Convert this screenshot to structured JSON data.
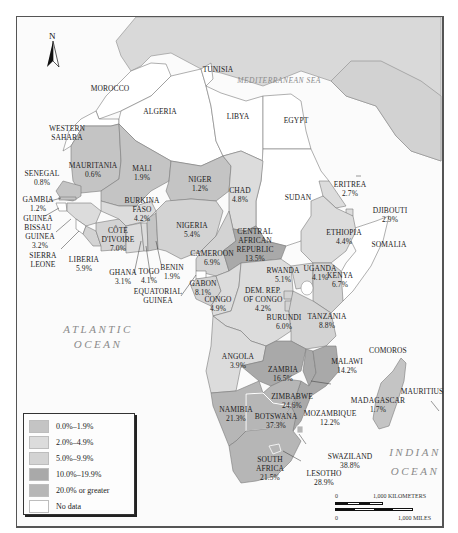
{
  "map": {
    "compass": {
      "label": "N",
      "icon": "north-arrow-icon"
    },
    "seas": {
      "mediterranean": "MEDITERRANEAN SEA",
      "red_sea": "RED SEA",
      "atlantic": [
        "ATLANTIC",
        "OCEAN"
      ],
      "indian": [
        "INDIAN",
        "OCEAN"
      ]
    },
    "countries": [
      {
        "name": "TUNISIA",
        "value": null,
        "category": "No data"
      },
      {
        "name": "MOROCCO",
        "value": null,
        "category": "No data"
      },
      {
        "name": "ALGERIA",
        "value": null,
        "category": "No data"
      },
      {
        "name": "LIBYA",
        "value": null,
        "category": "No data"
      },
      {
        "name": "EGYPT",
        "value": null,
        "category": "No data"
      },
      {
        "name": "WESTERN SAHARA",
        "value": null,
        "category": "No data"
      },
      {
        "name": "MAURITANIA",
        "value": "0.6%",
        "category": "0.0%–1.9%"
      },
      {
        "name": "MALI",
        "value": "1.9%",
        "category": "0.0%–1.9%"
      },
      {
        "name": "NIGER",
        "value": "1.2%",
        "category": "0.0%–1.9%"
      },
      {
        "name": "CHAD",
        "value": "4.8%",
        "category": "2.0%–4.9%"
      },
      {
        "name": "SUDAN",
        "value": null,
        "category": "No data"
      },
      {
        "name": "ERITREA",
        "value": "2.7%",
        "category": "2.0%–4.9%"
      },
      {
        "name": "DJIBOUTI",
        "value": "2.9%",
        "category": "2.0%–4.9%"
      },
      {
        "name": "ETHIOPIA",
        "value": "4.4%",
        "category": "2.0%–4.9%"
      },
      {
        "name": "SOMALIA",
        "value": null,
        "category": "No data"
      },
      {
        "name": "SENEGAL",
        "value": "0.8%",
        "category": "0.0%–1.9%"
      },
      {
        "name": "GAMBIA",
        "value": "1.2%",
        "category": "0.0%–1.9%"
      },
      {
        "name": "GUINEA BISSAU",
        "value": null,
        "category": "No data"
      },
      {
        "name": "GUINEA",
        "value": "3.2%",
        "category": "2.0%–4.9%"
      },
      {
        "name": "SIERRA LEONE",
        "value": null,
        "category": "No data"
      },
      {
        "name": "LIBERIA",
        "value": "5.9%",
        "category": "5.0%–9.9%"
      },
      {
        "name": "CÔTE D'IVOIRE",
        "value": "7.0%",
        "category": "5.0%–9.9%"
      },
      {
        "name": "BURKINA FASO",
        "value": "4.2%",
        "category": "2.0%–4.9%"
      },
      {
        "name": "GHANA",
        "value": "3.1%",
        "category": "2.0%–4.9%"
      },
      {
        "name": "TOGO",
        "value": "4.1%",
        "category": "2.0%–4.9%"
      },
      {
        "name": "BENIN",
        "value": "1.9%",
        "category": "0.0%–1.9%"
      },
      {
        "name": "NIGERIA",
        "value": "5.4%",
        "category": "5.0%–9.9%"
      },
      {
        "name": "CAMEROON",
        "value": "6.9%",
        "category": "5.0%–9.9%"
      },
      {
        "name": "EQUATORIAL GUINEA",
        "value": null,
        "category": "No data"
      },
      {
        "name": "CENTRAL AFRICAN REPUBLIC",
        "value": "13.5%",
        "category": "10.0%–19.9%"
      },
      {
        "name": "GABON",
        "value": "8.1%",
        "category": "5.0%–9.9%"
      },
      {
        "name": "CONGO",
        "value": "4.9%",
        "category": "2.0%–4.9%"
      },
      {
        "name": "DEM. REP. OF CONGO",
        "value": "4.2%",
        "category": "2.0%–4.9%"
      },
      {
        "name": "RWANDA",
        "value": "5.1%",
        "category": "5.0%–9.9%"
      },
      {
        "name": "UGANDA",
        "value": "4.1%",
        "category": "2.0%–4.9%"
      },
      {
        "name": "KENYA",
        "value": "6.7%",
        "category": "5.0%–9.9%"
      },
      {
        "name": "BURUNDI",
        "value": "6.0%",
        "category": "5.0%–9.9%"
      },
      {
        "name": "TANZANIA",
        "value": "8.8%",
        "category": "5.0%–9.9%"
      },
      {
        "name": "ANGOLA",
        "value": "3.9%",
        "category": "2.0%–4.9%"
      },
      {
        "name": "ZAMBIA",
        "value": "16.5%",
        "category": "10.0%–19.9%"
      },
      {
        "name": "MALAWI",
        "value": "14.2%",
        "category": "10.0%–19.9%"
      },
      {
        "name": "COMOROS",
        "value": null,
        "category": "No data"
      },
      {
        "name": "ZIMBABWE",
        "value": "24.6%",
        "category": "20.0% or greater"
      },
      {
        "name": "MOZAMBIQUE",
        "value": "12.2%",
        "category": "10.0%–19.9%"
      },
      {
        "name": "MADAGASCAR",
        "value": "1.7%",
        "category": "0.0%–1.9%"
      },
      {
        "name": "MAURITIUS",
        "value": null,
        "category": "No data"
      },
      {
        "name": "NAMIBIA",
        "value": "21.3%",
        "category": "20.0% or greater"
      },
      {
        "name": "BOTSWANA",
        "value": "37.3%",
        "category": "20.0% or greater"
      },
      {
        "name": "SWAZILAND",
        "value": "38.8%",
        "category": "20.0% or greater"
      },
      {
        "name": "SOUTH AFRICA",
        "value": "21.5%",
        "category": "20.0% or greater"
      },
      {
        "name": "LESOTHO",
        "value": "28.9%",
        "category": "20.0% or greater"
      }
    ],
    "labels": {
      "tunisia": "TUNISIA",
      "morocco": "MOROCCO",
      "algeria": "ALGERIA",
      "libya": "LIBYA",
      "egypt": "EGYPT",
      "western_sahara_1": "WESTERN",
      "western_sahara_2": "SAHARA",
      "mauritania": "MAURITANIA",
      "mauritania_v": "0.6%",
      "mali": "MALI",
      "mali_v": "1.9%",
      "niger": "NIGER",
      "niger_v": "1.2%",
      "chad": "CHAD",
      "chad_v": "4.8%",
      "sudan": "SUDAN",
      "eritrea": "ERITREA",
      "eritrea_v": "2.7%",
      "djibouti": "DJIBOUTI",
      "djibouti_v": "2.9%",
      "ethiopia": "ETHIOPIA",
      "ethiopia_v": "4.4%",
      "somalia": "SOMALIA",
      "senegal": "SENEGAL",
      "senegal_v": "0.8%",
      "gambia": "GAMBIA",
      "gambia_v": "1.2%",
      "guinea_bissau_1": "GUINEA",
      "guinea_bissau_2": "BISSAU",
      "guinea": "GUINEA",
      "guinea_v": "3.2%",
      "sierra_leone_1": "SIERRA",
      "sierra_leone_2": "LEONE",
      "liberia": "LIBERIA",
      "liberia_v": "5.9%",
      "cote_1": "CÔTE",
      "cote_2": "D'IVOIRE",
      "cote_v": "7.0%",
      "burkina_1": "BURKINA",
      "burkina_2": "FASO",
      "burkina_v": "4.2%",
      "ghana": "GHANA",
      "ghana_v": "3.1%",
      "togo": "TOGO",
      "togo_v": "4.1%",
      "benin": "BENIN",
      "benin_v": "1.9%",
      "nigeria": "NIGERIA",
      "nigeria_v": "5.4%",
      "cameroon": "CAMEROON",
      "cameroon_v": "6.9%",
      "eq_guinea_1": "EQUATORIAL",
      "eq_guinea_2": "GUINEA",
      "car_1": "CENTRAL",
      "car_2": "AFRICAN",
      "car_3": "REPUBLIC",
      "car_v": "13.5%",
      "gabon": "GABON",
      "gabon_v": "8.1%",
      "congo": "CONGO",
      "congo_v": "4.9%",
      "drc_1": "DEM. REP.",
      "drc_2": "OF CONGO",
      "drc_v": "4.2%",
      "rwanda": "RWANDA",
      "rwanda_v": "5.1%",
      "uganda": "UGANDA",
      "uganda_v": "4.1%",
      "kenya": "KENYA",
      "kenya_v": "6.7%",
      "burundi": "BURUNDI",
      "burundi_v": "6.0%",
      "tanzania": "TANZANIA",
      "tanzania_v": "8.8%",
      "angola": "ANGOLA",
      "angola_v": "3.9%",
      "zambia": "ZAMBIA",
      "zambia_v": "16.5%",
      "malawi": "MALAWI",
      "malawi_v": "14.2%",
      "comoros": "COMOROS",
      "zimbabwe": "ZIMBABWE",
      "zimbabwe_v": "24.6%",
      "mozambique": "MOZAMBIQUE",
      "mozambique_v": "12.2%",
      "madagascar": "MADAGASCAR",
      "madagascar_v": "1.7%",
      "mauritius": "MAURITIUS",
      "namibia": "NAMIBIA",
      "namibia_v": "21.3%",
      "botswana": "BOTSWANA",
      "botswana_v": "37.3%",
      "swaziland": "SWAZILAND",
      "swaziland_v": "38.8%",
      "south_africa_1": "SOUTH",
      "south_africa_2": "AFRICA",
      "south_africa_v": "21.5%",
      "lesotho": "LESOTHO",
      "lesotho_v": "28.9%"
    }
  },
  "legend": {
    "items": [
      {
        "label": "0.0%–1.9%",
        "color": "#c4c4c4"
      },
      {
        "label": "2.0%–4.9%",
        "color": "#dcdcdc"
      },
      {
        "label": "5.0%–9.9%",
        "color": "#d3d3d3"
      },
      {
        "label": "10.0%–19.9%",
        "color": "#a9a9a9"
      },
      {
        "label": "20.0% or greater",
        "color": "#b6b6b6"
      },
      {
        "label": "No data",
        "color": "#ffffff"
      }
    ]
  },
  "scale": {
    "km_zero": "0",
    "km_label": "1,000 KILOMETERS",
    "mi_zero": "0",
    "mi_label": "1,000 MILES"
  },
  "colors": {
    "outside": "#d9d9d9",
    "no_data": "#ffffff",
    "c0": "#c4c4c4",
    "c2": "#dcdcdc",
    "c5": "#d3d3d3",
    "c10": "#a9a9a9",
    "c20": "#b6b6b6",
    "border": "#7a7a7a"
  }
}
